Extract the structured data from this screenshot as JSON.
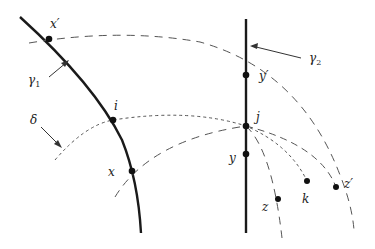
{
  "diagram": {
    "title": "",
    "curves": [
      {
        "id": "gamma1",
        "label": "γ",
        "subscript": "1",
        "style": "solid-thick"
      },
      {
        "id": "gamma2",
        "label": "γ",
        "subscript": "2",
        "style": "solid-thick"
      },
      {
        "id": "delta",
        "label": "δ",
        "style": "short-dashed"
      }
    ],
    "points": [
      {
        "id": "x_prime",
        "label": "x′"
      },
      {
        "id": "i",
        "label": "i"
      },
      {
        "id": "x",
        "label": "x"
      },
      {
        "id": "y_prime",
        "label": "y′"
      },
      {
        "id": "j",
        "label": "j"
      },
      {
        "id": "y",
        "label": "y"
      },
      {
        "id": "z",
        "label": "z"
      },
      {
        "id": "k",
        "label": "k"
      },
      {
        "id": "z_prime",
        "label": "z′"
      }
    ],
    "labels": {
      "gamma1": "γ",
      "gamma1_sub": "1",
      "gamma2": "γ",
      "gamma2_sub": "2",
      "delta": "δ",
      "x_prime": "x′",
      "i": "i",
      "x": "x",
      "y_prime": "y′",
      "j": "j",
      "y": "y",
      "z": "z",
      "k": "k",
      "z_prime": "z′"
    },
    "colors": {
      "line": "#1a1a1a",
      "dashed": "#555555",
      "text": "#222222"
    }
  }
}
